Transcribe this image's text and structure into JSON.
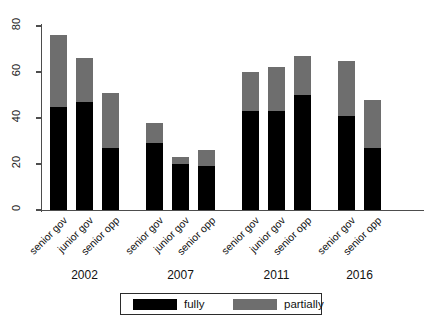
{
  "chart_data": {
    "type": "bar",
    "title": "",
    "subtitle": "",
    "xlabel": "",
    "ylabel": "",
    "stacked": true,
    "grid": false,
    "legend_position": "bottom-center",
    "ylim": [
      0,
      80
    ],
    "yticks": [
      0,
      20,
      40,
      60,
      80
    ],
    "ytick_labels": [
      "0",
      "20",
      "40",
      "60",
      "80"
    ],
    "categories": [
      "senior gov",
      "junior gov",
      "senior opp",
      "senior gov",
      "junior gov",
      "senior opp",
      "senior gov",
      "junior gov",
      "senior opp",
      "senior gov",
      "senior opp"
    ],
    "groups": [
      {
        "label": "2002",
        "categories": [
          "senior gov",
          "junior gov",
          "senior opp"
        ]
      },
      {
        "label": "2007",
        "categories": [
          "senior gov",
          "junior gov",
          "senior opp"
        ]
      },
      {
        "label": "2011",
        "categories": [
          "senior gov",
          "junior gov",
          "senior opp"
        ]
      },
      {
        "label": "2016",
        "categories": [
          "senior gov",
          "senior opp"
        ]
      }
    ],
    "series": [
      {
        "name": "fully",
        "color": "#000000",
        "values": [
          45,
          47,
          27,
          29,
          20,
          19,
          43,
          43,
          50,
          41,
          27
        ]
      },
      {
        "name": "partially",
        "color": "#6e6e6e",
        "values": [
          31,
          19,
          24,
          9,
          3,
          7,
          17,
          19,
          17,
          24,
          21
        ]
      }
    ],
    "totals": [
      76,
      66,
      51,
      38,
      23,
      26,
      60,
      62,
      67,
      65,
      48
    ]
  },
  "legend": {
    "items": [
      {
        "label": "fully",
        "color": "#000000"
      },
      {
        "label": "partially",
        "color": "#6e6e6e"
      }
    ]
  }
}
